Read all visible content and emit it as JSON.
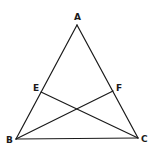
{
  "diagram": {
    "type": "geometry",
    "points": {
      "A": {
        "label": "A",
        "x": 77,
        "y": 25,
        "label_x": 74,
        "label_y": 20
      },
      "B": {
        "label": "B",
        "x": 16,
        "y": 139,
        "label_x": 6,
        "label_y": 143
      },
      "C": {
        "label": "C",
        "x": 138,
        "y": 138,
        "label_x": 141,
        "label_y": 142
      },
      "E": {
        "label": "E",
        "x": 41,
        "y": 92,
        "label_x": 33,
        "label_y": 91
      },
      "F": {
        "label": "F",
        "x": 113,
        "y": 91,
        "label_x": 116,
        "label_y": 91
      }
    },
    "segments": [
      {
        "from": "A",
        "to": "B"
      },
      {
        "from": "A",
        "to": "C"
      },
      {
        "from": "B",
        "to": "C"
      },
      {
        "from": "B",
        "to": "F"
      },
      {
        "from": "C",
        "to": "E"
      }
    ],
    "line_color": "#1a1a1a",
    "background": "#ffffff"
  }
}
